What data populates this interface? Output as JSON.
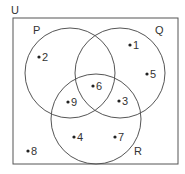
{
  "universe_label": "U",
  "sets": [
    {
      "label": "P",
      "cx": 70,
      "cy": 73,
      "r": 45,
      "lx": 33,
      "ly": 34
    },
    {
      "label": "Q",
      "cx": 120,
      "cy": 73,
      "r": 45,
      "lx": 155,
      "ly": 34
    },
    {
      "label": "R",
      "cx": 96,
      "cy": 119,
      "r": 45,
      "lx": 134,
      "ly": 155
    }
  ],
  "elements": [
    {
      "value": "1",
      "x": 130,
      "y": 45
    },
    {
      "value": "2",
      "x": 39,
      "y": 57
    },
    {
      "value": "5",
      "x": 147,
      "y": 74
    },
    {
      "value": "6",
      "x": 93,
      "y": 86
    },
    {
      "value": "9",
      "x": 68,
      "y": 102
    },
    {
      "value": "3",
      "x": 119,
      "y": 101
    },
    {
      "value": "4",
      "x": 74,
      "y": 137
    },
    {
      "value": "7",
      "x": 115,
      "y": 137
    },
    {
      "value": "8",
      "x": 28,
      "y": 151
    }
  ],
  "colors": {
    "stroke": "#555555",
    "text": "#333333"
  }
}
